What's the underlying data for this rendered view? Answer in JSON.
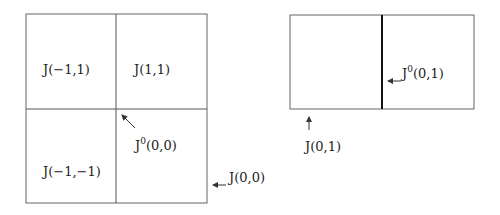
{
  "diagram": {
    "left_grid": {
      "cells": [
        {
          "label": "J(−1,1)"
        },
        {
          "label": "J(1,1)"
        },
        {
          "label": "J(−1,−1)"
        }
      ],
      "annotations": {
        "center_label_base": "J",
        "center_label_sup": "0",
        "center_label_args": "(0,0)",
        "right_label": "J(0,0)"
      }
    },
    "right_grid": {
      "annotations": {
        "divider_label_base": "J",
        "divider_label_sup": "0",
        "divider_label_args": "(0,1)",
        "bottom_label": "J(0,1)"
      }
    },
    "colors": {
      "line": "#555555",
      "thick_line": "#111111",
      "text": "#222222"
    }
  }
}
